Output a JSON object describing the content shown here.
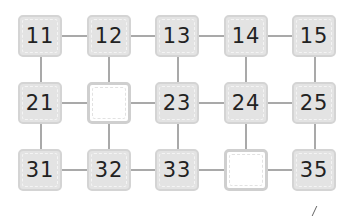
{
  "puzzle": {
    "rows": [
      [
        "11",
        "12",
        "13",
        "14",
        "15"
      ],
      [
        "21",
        "",
        "23",
        "24",
        "25"
      ],
      [
        "31",
        "32",
        "33",
        "",
        "35"
      ]
    ],
    "blanks": [
      [
        1,
        1
      ],
      [
        2,
        3
      ]
    ],
    "colors": {
      "cell_fill": "#e3e3e3",
      "cell_border": "#d4d4d4",
      "blank_border": "#cfcfcf",
      "connector": "#a9a9a9",
      "text": "#222222"
    }
  }
}
